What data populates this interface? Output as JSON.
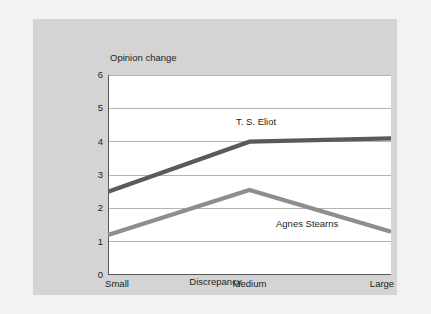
{
  "chart_data": {
    "type": "line",
    "title": "",
    "xlabel": "Discrepancy",
    "ylabel": "Opinion change",
    "categories": [
      "Small",
      "Medium",
      "Large"
    ],
    "ylim": [
      0,
      6
    ],
    "yticks": [
      "0",
      "1",
      "2",
      "3",
      "4",
      "5",
      "6"
    ],
    "grid": true,
    "legend_position": "inline-annotation",
    "series": [
      {
        "name": "T. S. Eliot",
        "values": [
          2.5,
          4.0,
          4.1
        ],
        "color": "#5a5a5a"
      },
      {
        "name": "Agnes Stearns",
        "values": [
          1.2,
          2.55,
          1.3
        ],
        "color": "#8e8e8e"
      }
    ]
  },
  "colors": {
    "page_background": "#f2f2f2",
    "panel_background": "#d4d4d4",
    "plot_background": "#ffffff",
    "gridline": "#b4b4b4",
    "axis_line": "#595959",
    "text": "#231f20"
  }
}
